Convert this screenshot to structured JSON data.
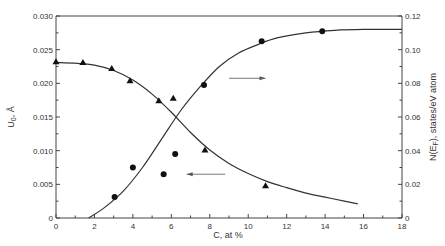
{
  "chart_data": {
    "type": "scatter",
    "title": "",
    "xlabel": "C, at %",
    "ylabel_left": "U₀, Å",
    "ylabel_right": "N(E_F), states/eV atom",
    "xlim": [
      0,
      18
    ],
    "ylim_left": [
      0,
      0.03
    ],
    "ylim_right": [
      0,
      0.12
    ],
    "x_ticks": [
      "0",
      "2",
      "4",
      "6",
      "8",
      "10",
      "12",
      "14",
      "16",
      "18"
    ],
    "y_left_ticks": [
      "0",
      "0.005",
      "0.010",
      "0.015",
      "0.020",
      "0.025",
      "0.030"
    ],
    "y_right_ticks": [
      "0",
      "0.02",
      "0.04",
      "0.06",
      "0.08",
      "0.10",
      "0.12"
    ],
    "grid": false,
    "legend": "none (arrows indicate axis: left arrow near U₀ curve, right arrow near N(E_F) curve)",
    "series": [
      {
        "name": "U0 (triangles, left axis)",
        "marker": "triangle",
        "axis": "left",
        "x": [
          0,
          1.4,
          2.9,
          3.85,
          5.35,
          6.1,
          7.75,
          10.9
        ],
        "y": [
          0.0232,
          0.0231,
          0.0222,
          0.0204,
          0.0174,
          0.0178,
          0.0101,
          0.0048
        ],
        "fit_curve": {
          "x": [
            0,
            1,
            2,
            3,
            4,
            5,
            6,
            7,
            8,
            9,
            10,
            11,
            12,
            13,
            14,
            15,
            15.7
          ],
          "y": [
            0.0231,
            0.023,
            0.0227,
            0.0219,
            0.0205,
            0.0184,
            0.0157,
            0.0127,
            0.0101,
            0.0081,
            0.0066,
            0.0054,
            0.0045,
            0.0037,
            0.0031,
            0.0025,
            0.0021
          ]
        }
      },
      {
        "name": "N(E_F) (circles, right axis)",
        "marker": "circle",
        "axis": "right",
        "x": [
          3.05,
          4.0,
          5.6,
          6.2,
          7.7,
          10.7,
          13.85
        ],
        "y": [
          0.0125,
          0.03,
          0.026,
          0.038,
          0.079,
          0.105,
          0.111
        ],
        "fit_curve": {
          "x": [
            1.7,
            2.5,
            3.5,
            4.5,
            5.5,
            6.5,
            7.5,
            8.5,
            9.5,
            10.5,
            11.5,
            13,
            14.5,
            16,
            18
          ],
          "y": [
            0.0,
            0.006,
            0.016,
            0.03,
            0.047,
            0.064,
            0.078,
            0.09,
            0.098,
            0.103,
            0.107,
            0.11,
            0.1115,
            0.112,
            0.112
          ]
        }
      }
    ],
    "annotations": [
      {
        "type": "arrow",
        "direction": "left",
        "at_x": [
          6.8,
          8.8
        ],
        "at_y_left": 0.0065
      },
      {
        "type": "arrow",
        "direction": "right",
        "at_x": [
          9.0,
          10.9
        ],
        "at_y_right": 0.083
      }
    ]
  }
}
